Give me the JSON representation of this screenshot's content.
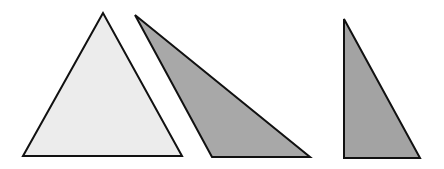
{
  "figure": {
    "width": 444,
    "height": 169,
    "background": "#ffffff",
    "stroke_color": "#111111",
    "stroke_width": 2,
    "shapes": [
      {
        "name": "acute-triangle",
        "fill": "#ececec",
        "points": "103,13 23,156 182,156"
      },
      {
        "name": "obtuse-triangle",
        "fill": "#a8a8a8",
        "points": "135,15 212,157 310,157"
      },
      {
        "name": "right-triangle",
        "fill": "#a3a3a3",
        "points": "344,19 344,158 420,158"
      }
    ]
  }
}
